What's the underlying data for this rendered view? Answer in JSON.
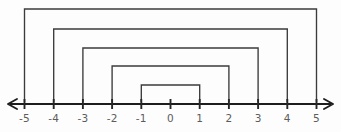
{
  "figure": {
    "background_color": "#fdfdfd",
    "line_color": "#1d1d1d",
    "bracket_color": "#3b3b3b",
    "label_color": "#5c5c5c"
  },
  "chart_data": {
    "type": "line",
    "xlabel": "",
    "ylabel": "",
    "xlim": [
      -5.6,
      5.6
    ],
    "grid": false,
    "legend": null,
    "axis": {
      "orientation": "horizontal",
      "arrow_left": true,
      "arrow_right": true,
      "tick_values": [
        -5,
        -4,
        -3,
        -2,
        -1,
        0,
        1,
        2,
        3,
        4,
        5
      ],
      "tick_labels": [
        "-5",
        "-4",
        "-3",
        "-2",
        "-1",
        "0",
        "1",
        "2",
        "3",
        "4",
        "5"
      ]
    },
    "brackets": [
      {
        "name": "bracket-5",
        "start": -5,
        "end": 5,
        "level": 1,
        "top_y": 9
      },
      {
        "name": "bracket-4",
        "start": -4,
        "end": 4,
        "level": 2,
        "top_y": 29
      },
      {
        "name": "bracket-3",
        "start": -3,
        "end": 3,
        "level": 3,
        "top_y": 48
      },
      {
        "name": "bracket-2",
        "start": -2,
        "end": 2,
        "level": 4,
        "top_y": 66
      },
      {
        "name": "bracket-1",
        "start": -1,
        "end": 1,
        "level": 5,
        "top_y": 85
      }
    ],
    "categories": [
      "-5",
      "-4",
      "-3",
      "-2",
      "-1",
      "0",
      "1",
      "2",
      "3",
      "4",
      "5"
    ],
    "values": [
      0,
      0,
      0,
      0,
      0,
      0,
      0,
      0,
      0,
      0,
      0
    ]
  },
  "geometry": {
    "axis_y": 104,
    "origin_x": 170.5,
    "unit_px": 29.2,
    "arrow_left_tip_x": 8,
    "arrow_right_tip_x": 333,
    "tick_half_height": 5,
    "label_y": 122
  }
}
